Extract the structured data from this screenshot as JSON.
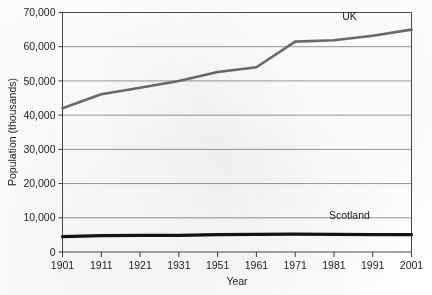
{
  "chart_data": {
    "type": "line",
    "title": "",
    "xlabel": "Year",
    "ylabel": "Population (thousands)",
    "x": [
      1901,
      1911,
      1921,
      1931,
      1951,
      1961,
      1971,
      1981,
      1991,
      2001
    ],
    "xtick_labels": [
      "1901",
      "1911",
      "1921",
      "1931",
      "1951",
      "1961",
      "1971",
      "1981",
      "1991",
      "2001"
    ],
    "ytick_labels": [
      "0",
      "10,000",
      "20,000",
      "30,000",
      "40,000",
      "50,000",
      "60,000",
      "70,000"
    ],
    "ytick_values": [
      0,
      10000,
      20000,
      30000,
      40000,
      50000,
      60000,
      70000
    ],
    "ylim": [
      0,
      70000
    ],
    "grid": "horizontal",
    "legend": "inline-labels",
    "series": [
      {
        "name": "UK",
        "color": "#6b6b6b",
        "line_width": 2.6,
        "label_x": 1985,
        "label_y": 67800,
        "values": [
          42000,
          46100,
          48000,
          50000,
          52600,
          54000,
          61500,
          61900,
          63200,
          65000
        ]
      },
      {
        "name": "Scotland",
        "color": "#141414",
        "line_width": 3.2,
        "label_x": 1985,
        "label_y": 9600,
        "values": [
          4480,
          4760,
          4880,
          4840,
          5100,
          5180,
          5230,
          5180,
          5100,
          5060
        ]
      }
    ]
  }
}
